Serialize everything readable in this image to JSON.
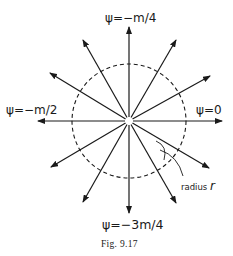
{
  "figure": {
    "caption": "Fig. 9.17",
    "center": {
      "x": 129,
      "y": 121
    },
    "circle": {
      "radius": 57,
      "style": "dashed"
    },
    "labels": {
      "top": "ψ=−m/4",
      "left": "ψ=−m/2",
      "right": "ψ=0",
      "bottom": "ψ=−3m/4",
      "radius_prefix": "radius ",
      "radius_symbol": "r"
    },
    "arrows": [
      {
        "name": "arrow-up",
        "tip": [
          129,
          27
        ]
      },
      {
        "name": "arrow-down",
        "tip": [
          129,
          213
        ]
      },
      {
        "name": "arrow-left",
        "tip": [
          38,
          121
        ]
      },
      {
        "name": "arrow-right",
        "tip": [
          222,
          121
        ]
      },
      {
        "name": "arrow-upper-left-steep",
        "tip": [
          83,
          40
        ]
      },
      {
        "name": "arrow-upper-left-shallow",
        "tip": [
          50,
          73
        ]
      },
      {
        "name": "arrow-upper-right-steep",
        "tip": [
          176,
          40
        ]
      },
      {
        "name": "arrow-upper-right-shallow",
        "tip": [
          210,
          76
        ]
      },
      {
        "name": "arrow-lower-left-shallow",
        "tip": [
          51,
          167
        ]
      },
      {
        "name": "arrow-lower-left-steep",
        "tip": [
          83,
          202
        ]
      },
      {
        "name": "arrow-lower-right-steep",
        "tip": [
          176,
          203
        ]
      },
      {
        "name": "arrow-lower-right-shallow",
        "tip": [
          209,
          168
        ]
      }
    ],
    "colors": {
      "ink": "#1a1a1a",
      "background": "#ffffff"
    }
  }
}
